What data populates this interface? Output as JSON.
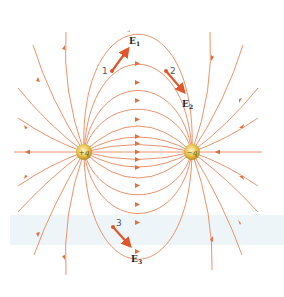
{
  "diagram": {
    "charges": [
      {
        "label": "+q",
        "x": 84,
        "y": 152,
        "sign": "positive"
      },
      {
        "label": "−q",
        "x": 192,
        "y": 152,
        "sign": "negative"
      }
    ],
    "points": [
      {
        "label": "1",
        "x": 112,
        "y": 71
      },
      {
        "label": "2",
        "x": 166,
        "y": 71
      },
      {
        "label": "3",
        "x": 113,
        "y": 227
      }
    ],
    "vectors": [
      {
        "label": "E",
        "subscript": "1",
        "from_point": "1"
      },
      {
        "label": "E",
        "subscript": "2",
        "from_point": "2"
      },
      {
        "label": "E",
        "subscript": "3",
        "from_point": "3"
      }
    ],
    "colors": {
      "field_line": "#e8875a",
      "vector": "#e0562a",
      "charge": "#e9c24a"
    }
  }
}
